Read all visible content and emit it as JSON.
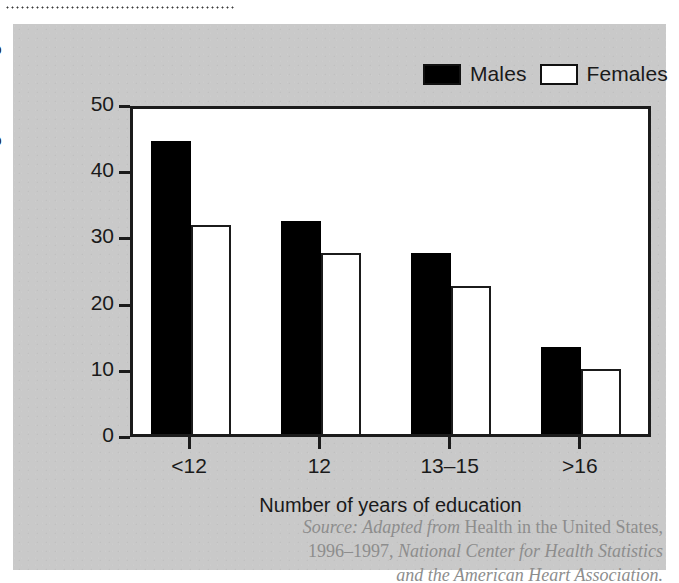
{
  "figure": {
    "panel_background": "#c9c9c9",
    "plot_background": "#ffffff",
    "axis_color": "#1b1b1b",
    "source_color": "#8d8d8d",
    "source": {
      "prefix_italic": "Source: Adapted from ",
      "work_roman": "Health in the United States,",
      "year_roman": "1996–1997, ",
      "publisher_italic": "National Center for Health Statistics",
      "publisher_italic_2": "and the American Heart Association."
    }
  },
  "legend": {
    "position": "top-right",
    "entries": [
      {
        "label": "Males",
        "color": "#000000",
        "icon": "filled-square-swatch"
      },
      {
        "label": "Females",
        "color": "#ffffff",
        "icon": "outlined-square-swatch"
      }
    ]
  },
  "chart_data": {
    "type": "bar",
    "title": "",
    "xlabel": "Number of years of education",
    "ylabel": "Percentage smoking",
    "categories": [
      "<12",
      "12",
      "13–15",
      ">16"
    ],
    "series": [
      {
        "name": "Males",
        "color": "#000000",
        "values": [
          44.2,
          32.2,
          27.3,
          13.2
        ]
      },
      {
        "name": "Females",
        "color": "#ffffff",
        "values": [
          31.5,
          27.4,
          22.3,
          9.8
        ]
      }
    ],
    "ylim": [
      0,
      50
    ],
    "yticks": [
      0,
      10,
      20,
      30,
      40,
      50
    ],
    "ytick_labels": [
      "0",
      "10",
      "20",
      "30",
      "40",
      "50"
    ],
    "grid": false,
    "legend_position": "top-right"
  }
}
